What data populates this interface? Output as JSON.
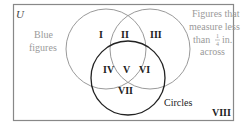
{
  "diagram": {
    "universe_label": "U",
    "colors": {
      "border": "#888888",
      "light_circle": "#9a9a9a",
      "dark_circle": "#222222",
      "light_text": "#9a9a9a",
      "dark_text": "#222222"
    },
    "sets": [
      {
        "name": "blue",
        "label_line1": "Blue",
        "label_line2": "figures"
      },
      {
        "name": "small",
        "label_line1": "Figures that",
        "label_line2": "measure less",
        "label_line3_pre": "than",
        "label_frac_num": "1",
        "label_frac_den": "4",
        "label_line3_post": "in.",
        "label_line4": "across"
      },
      {
        "name": "circles",
        "label": "Circles"
      }
    ],
    "regions": [
      "I",
      "II",
      "III",
      "IV",
      "V",
      "VI",
      "VII",
      "VIII"
    ]
  }
}
